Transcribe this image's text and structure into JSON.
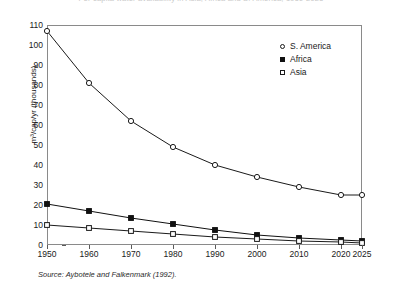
{
  "chart_data": {
    "type": "line",
    "title": "Per capita water availability in Asia, Africa and S. America, 1950-2025",
    "xlabel": "",
    "ylabel": "m³/cap/yr (thousands)",
    "x": [
      1950,
      1960,
      1970,
      1980,
      1990,
      2000,
      2010,
      2020,
      2025
    ],
    "xtick_labels": [
      "1950",
      "1960",
      "1970",
      "1980",
      "1990",
      "2000",
      "2010",
      "2020",
      "2025"
    ],
    "ytick_labels": [
      "0",
      "10",
      "20",
      "30",
      "40",
      "50",
      "60",
      "70",
      "80",
      "90",
      "100",
      "110"
    ],
    "ytick_values": [
      0,
      10,
      20,
      30,
      40,
      50,
      60,
      70,
      80,
      90,
      100,
      110
    ],
    "ylim": [
      0,
      110
    ],
    "xlim": [
      1950,
      2025
    ],
    "grid": false,
    "legend_position": "top-right",
    "series": [
      {
        "name": "S. America",
        "marker": "open-circle",
        "color": "#1a1a1a",
        "values": [
          107,
          81,
          62,
          49,
          40,
          34,
          29,
          25,
          25
        ]
      },
      {
        "name": "Africa",
        "marker": "filled-square",
        "color": "#111111",
        "values": [
          20.5,
          17,
          13.5,
          10.5,
          7.5,
          5,
          3.5,
          2.5,
          2
        ]
      },
      {
        "name": "Asia",
        "marker": "open-square",
        "color": "#1a1a1a",
        "values": [
          10,
          8.5,
          7,
          5.5,
          4,
          3,
          2,
          1.5,
          1
        ]
      }
    ],
    "source": "Source: Aybotele and Falkenmark (1992)."
  },
  "legend": {
    "items": [
      {
        "label": "S. America",
        "marker": "open-circle"
      },
      {
        "label": "Africa",
        "marker": "filled-square"
      },
      {
        "label": "Asia",
        "marker": "open-square"
      }
    ]
  },
  "axes": {
    "y_label": "m³/cap/yr (thousands)"
  },
  "footer": {
    "source": "Source: Aybotele and Falkenmark (1992)."
  },
  "colors": {
    "line": "#1a1a1a",
    "frame": "#8a8a8a",
    "text": "#1a1a1a",
    "title": "#c9c9c9",
    "background": "#ffffff"
  }
}
